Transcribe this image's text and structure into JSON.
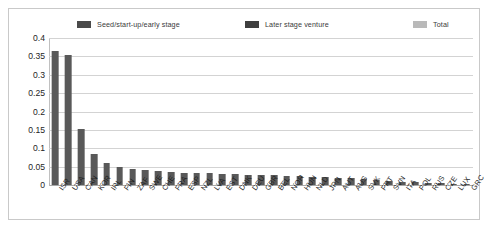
{
  "legend": {
    "items": [
      {
        "label": "Seed/start-up/early stage",
        "color": "#4a4a4a",
        "name": "legend-seed"
      },
      {
        "label": "Later stage venture",
        "color": "#3f3f3f",
        "name": "legend-later"
      },
      {
        "label": "Total",
        "color": "#b9b9b9",
        "name": "legend-total"
      }
    ]
  },
  "chart_data": {
    "type": "bar",
    "title": "",
    "xlabel": "",
    "ylabel": "",
    "ylim": [
      0,
      0.4
    ],
    "yticks": [
      "0",
      "0.05",
      "0.1",
      "0.15",
      "0.2",
      "0.25",
      "0.3",
      "0.35",
      "0.4"
    ],
    "ytick_values": [
      0,
      0.05,
      0.1,
      0.15,
      0.2,
      0.25,
      0.3,
      0.35,
      0.4
    ],
    "grid": true,
    "legend_position": "top",
    "categories": [
      "ISR",
      "USA",
      "CAN",
      "KOR",
      "IRL",
      "FIN",
      "ZAF",
      "SWE",
      "CHE",
      "FRA",
      "ESP",
      "NZL",
      "LVA",
      "EST",
      "DNK",
      "DEU",
      "GBR",
      "BEL",
      "NOR",
      "HUN",
      "NLD",
      "JPN",
      "AUT",
      "AUS",
      "SVK",
      "PRT",
      "SVN",
      "ITA",
      "POL",
      "RUS",
      "CZE",
      "LUX",
      "GRC"
    ],
    "series": [
      {
        "name": "Total",
        "values": [
          0.365,
          0.355,
          0.153,
          0.085,
          0.06,
          0.05,
          0.043,
          0.04,
          0.038,
          0.036,
          0.034,
          0.033,
          0.032,
          0.03,
          0.029,
          0.028,
          0.027,
          0.026,
          0.025,
          0.024,
          0.023,
          0.022,
          0.02,
          0.018,
          0.016,
          0.013,
          0.011,
          0.009,
          0.008,
          0.006,
          0.005,
          0.004,
          0.003
        ]
      }
    ]
  }
}
